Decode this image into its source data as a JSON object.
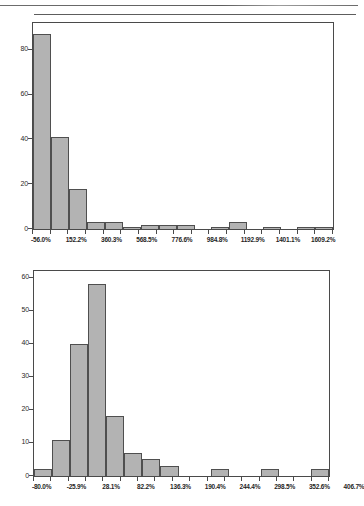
{
  "page": {
    "background": "#ffffff",
    "bar_fill": "#b3b3b3",
    "bar_stroke": "#4f4f4f",
    "axis_color": "#4a4a4a"
  },
  "chart_data": [
    {
      "id": "histogram-top",
      "type": "bar",
      "title": "",
      "subtitle": "",
      "xlabel": "",
      "ylabel": "",
      "grid": false,
      "legend": null,
      "orientation": "vertical",
      "bin_width_percent": 104.07,
      "xlim": [
        -108.0,
        1661.2
      ],
      "ylim": [
        0,
        92
      ],
      "categories": [
        "-56.0%",
        "48.1%",
        "152.2%",
        "256.2%",
        "360.3%",
        "464.4%",
        "568.5%",
        "672.5%",
        "776.6%",
        "880.7%",
        "984.8%",
        "1088.8%",
        "1192.9%",
        "1297.0%",
        "1401.1%",
        "1505.1%",
        "1609.2%"
      ],
      "values": [
        87,
        41,
        18,
        3,
        3,
        1,
        2,
        2,
        2,
        0,
        1,
        3,
        0,
        1,
        0,
        1,
        1
      ],
      "xtick_labels": [
        "-56.0%",
        "152.2%",
        "360.3%",
        "568.5%",
        "776.6%",
        "984.8%",
        "1192.9%",
        "1401.1%",
        "1609.2%"
      ],
      "xtick_label_every": 2,
      "ytick_labels": [
        "0",
        "20",
        "40",
        "60",
        "80"
      ],
      "ytick_values": [
        0,
        20,
        40,
        60,
        80
      ]
    },
    {
      "id": "histogram-bottom",
      "type": "bar",
      "title": "",
      "subtitle": "",
      "xlabel": "",
      "ylabel": "",
      "grid": false,
      "legend": null,
      "orientation": "vertical",
      "bin_width_percent": 27.04,
      "xlim": [
        -93.5,
        420.2
      ],
      "ylim": [
        0,
        62
      ],
      "categories": [
        "-80.0%",
        "-52.9%",
        "-25.9%",
        "1.1%",
        "28.1%",
        "55.2%",
        "82.2%",
        "109.3%",
        "136.3%",
        "163.4%",
        "190.4%",
        "217.4%",
        "244.4%",
        "271.5%",
        "298.5%",
        "325.6%",
        "352.6%",
        "379.7%",
        "406.7%"
      ],
      "values": [
        2,
        11,
        40,
        58,
        18,
        7,
        5,
        3,
        0,
        0,
        2,
        0,
        0,
        2,
        0,
        0,
        2
      ],
      "xtick_labels": [
        "-80.0%",
        "-25.9%",
        "28.1%",
        "82.2%",
        "136.3%",
        "190.4%",
        "244.4%",
        "298.5%",
        "352.6%",
        "406.7%"
      ],
      "xtick_label_every": 2,
      "ytick_labels": [
        "0",
        "10",
        "20",
        "30",
        "40",
        "50",
        "60"
      ],
      "ytick_values": [
        0,
        10,
        20,
        30,
        40,
        50,
        60
      ]
    }
  ]
}
